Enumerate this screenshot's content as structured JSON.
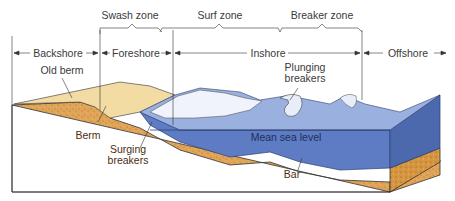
{
  "diagram": {
    "top_zones": [
      {
        "id": "swash",
        "label": "Swash zone"
      },
      {
        "id": "surf",
        "label": "Surf zone"
      },
      {
        "id": "breaker",
        "label": "Breaker zone"
      }
    ],
    "shore_zones": [
      {
        "id": "backshore",
        "label": "Backshore"
      },
      {
        "id": "foreshore",
        "label": "Foreshore"
      },
      {
        "id": "inshore",
        "label": "Inshore"
      },
      {
        "id": "offshore",
        "label": "Offshore"
      }
    ],
    "features": {
      "old_berm": "Old berm",
      "berm": "Berm",
      "surging_breakers_1": "Surging",
      "surging_breakers_2": "breakers",
      "plunging_breakers_1": "Plunging",
      "plunging_breakers_2": "breakers",
      "mean_sea_level": "Mean sea level",
      "bar": "Bar"
    },
    "colors": {
      "sand": "#e2a95a",
      "sand_dark": "#c98a3c",
      "dry_sand": "#f2d9a0",
      "water_top": "#8fa6d8",
      "water_front": "#5c78c0",
      "water_side": "#4c67ad",
      "foam": "#eef2fb",
      "line": "#333333"
    }
  }
}
